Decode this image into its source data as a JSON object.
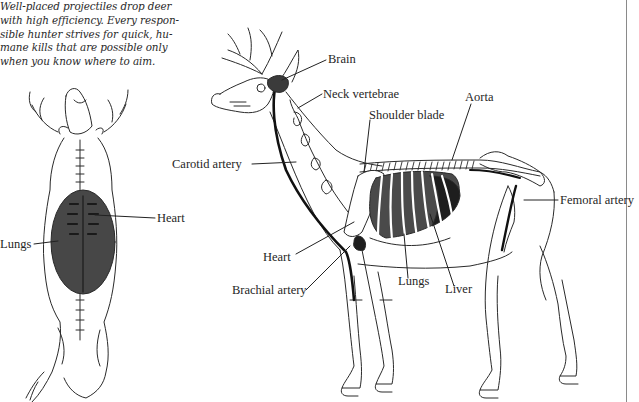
{
  "caption": {
    "lines": [
      "Well-placed projectiles drop deer",
      "with high efficiency. Every respon-",
      "sible hunter strives for quick, hu-",
      "mane kills that are possible only",
      "when you know where to aim."
    ]
  },
  "top_view": {
    "title": "Deer viewed from above",
    "labels": {
      "heart": "Heart",
      "lungs": "Lungs"
    }
  },
  "side_view": {
    "title": "Deer skeleton side view",
    "labels": {
      "brain": "Brain",
      "neck_vertebrae": "Neck vertebrae",
      "aorta": "Aorta",
      "shoulder_blade": "Shoulder blade",
      "carotid_artery": "Carotid artery",
      "femoral_artery": "Femoral artery",
      "heart": "Heart",
      "brachial_artery": "Brachial artery",
      "lungs": "Lungs",
      "liver": "Liver"
    }
  },
  "colors": {
    "ink": "#1e1e1e",
    "organ_fill": "#3a3a3a",
    "lung_fill": "#505050",
    "background": "#ffffff"
  }
}
